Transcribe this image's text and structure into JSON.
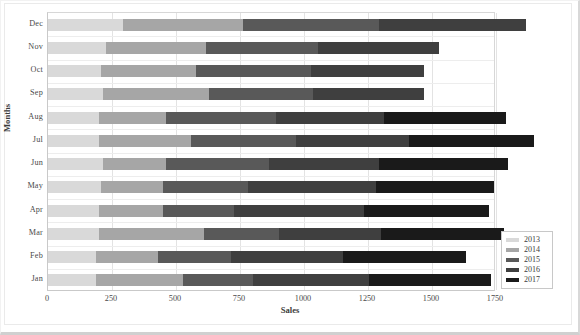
{
  "chart_data": {
    "type": "bar",
    "orientation": "horizontal",
    "stacked": true,
    "title": "",
    "xlabel": "Sales",
    "ylabel": "Months",
    "xlim": [
      0,
      1750
    ],
    "xticks": [
      0,
      250,
      500,
      750,
      1000,
      1250,
      1500,
      1750
    ],
    "xtick_labels": [
      "0",
      "250",
      "500",
      "750",
      "1000",
      "1250",
      "1500",
      "1750"
    ],
    "grid": true,
    "legend_position": "bottom-right",
    "categories": [
      "Dec",
      "Nov",
      "Oct",
      "Sep",
      "Aug",
      "Jul",
      "Jun",
      "May",
      "Apr",
      "Mar",
      "Feb",
      "Jan"
    ],
    "series": [
      {
        "name": "2013",
        "color": "#d9d9d9",
        "values": [
          293,
          227,
          207,
          215,
          199,
          199,
          215,
          207,
          199,
          199,
          188,
          188
        ]
      },
      {
        "name": "2014",
        "color": "#a6a6a6",
        "values": [
          469,
          391,
          371,
          414,
          262,
          359,
          246,
          242,
          250,
          410,
          242,
          340
        ]
      },
      {
        "name": "2015",
        "color": "#595959",
        "values": [
          531,
          438,
          449,
          406,
          430,
          410,
          402,
          332,
          277,
          293,
          285,
          273
        ]
      },
      {
        "name": "2016",
        "color": "#3f3f3f",
        "values": [
          574,
          473,
          441,
          434,
          422,
          441,
          430,
          500,
          508,
          398,
          438,
          453
        ]
      },
      {
        "name": "2017",
        "color": "#1a1a1a",
        "values": [
          0,
          0,
          0,
          0,
          477,
          488,
          504,
          461,
          488,
          480,
          480,
          477
        ]
      }
    ],
    "totals": [
      1867,
      1529,
      1468,
      1469,
      1790,
      1897,
      1797,
      1742,
      1722,
      1780,
      1633,
      1731
    ]
  },
  "legend": {
    "entries": [
      {
        "label": "2013"
      },
      {
        "label": "2014"
      },
      {
        "label": "2015"
      },
      {
        "label": "2016"
      },
      {
        "label": "2017"
      }
    ]
  }
}
